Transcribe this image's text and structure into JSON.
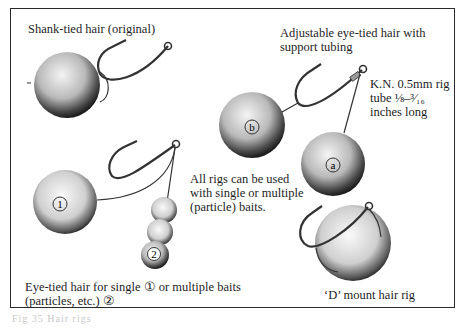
{
  "labels": {
    "shank_tied": "Shank-tied hair (original)",
    "adjustable_line1": "Adjustable eye-tied hair with",
    "adjustable_line2": "support tubing",
    "tube_line1": "K.N. 0.5mm rig",
    "tube_line2": "tube ⅛–³⁄₁₆",
    "tube_line3": "inches long",
    "all_rigs_line1": "All rigs can be used",
    "all_rigs_line2": "with single or multiple",
    "all_rigs_line3": "(particle) baits.",
    "eye_tied_line1": "Eye-tied hair for single ① or multiple baits",
    "eye_tied_line2": "(particles, etc.) ②",
    "d_mount": "‘D’ mount hair rig"
  },
  "bait_markers": {
    "single": "1",
    "multiple": "2",
    "a": "a",
    "b": "b"
  },
  "caption": "Fig 35  Hair rigs"
}
